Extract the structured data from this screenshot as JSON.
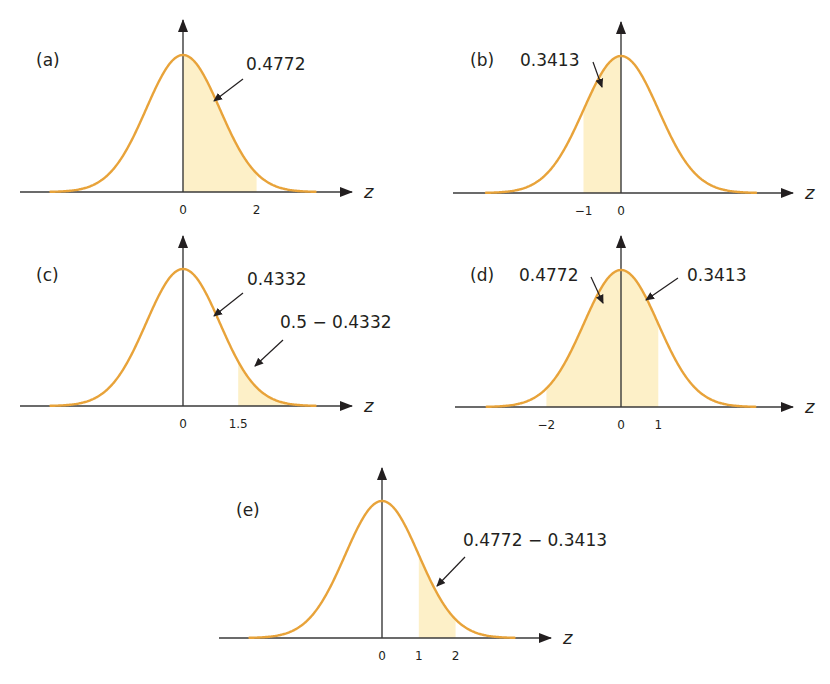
{
  "figure": {
    "colors": {
      "curve": "#e8a33a",
      "shade": "#fdf0c8",
      "axis": "#3a3a3a",
      "text": "#231f20",
      "background": "#ffffff"
    },
    "axis_label": "z"
  },
  "chart_data": [
    {
      "type": "area",
      "id": "a",
      "title": "(a)",
      "description": "Standard normal curve, shaded area between z=0 and z=2",
      "xlabel": "z",
      "xlim": [
        -3.6,
        3.6
      ],
      "tick_labels": [
        "0",
        "2"
      ],
      "tick_values": [
        0,
        2
      ],
      "shaded_interval": [
        0,
        2
      ],
      "annotations": [
        {
          "text": "0.4772",
          "points_to": "shaded region 0 to 2"
        }
      ],
      "layout": {
        "ox": 183,
        "oy": 192,
        "axis_start": 20,
        "axis_end": 352,
        "scale": 36.8,
        "height": 137,
        "yaxis_top": 20,
        "label_x": 36,
        "label_y": 66
      }
    },
    {
      "type": "area",
      "id": "b",
      "title": "(b)",
      "description": "Standard normal curve, shaded area between z=-1 and z=0",
      "xlabel": "z",
      "xlim": [
        -3.6,
        3.6
      ],
      "tick_labels": [
        "−1",
        "0"
      ],
      "tick_values": [
        -1,
        0
      ],
      "shaded_interval": [
        -1,
        0
      ],
      "annotations": [
        {
          "text": "0.3413",
          "points_to": "shaded region -1 to 0"
        }
      ],
      "layout": {
        "ox": 621,
        "oy": 193,
        "axis_start": 453,
        "axis_end": 793,
        "scale": 37.5,
        "height": 137,
        "yaxis_top": 22,
        "label_x": 470,
        "label_y": 66
      }
    },
    {
      "type": "area",
      "id": "c",
      "title": "(c)",
      "description": "Standard normal curve, shaded upper tail beyond z=1.5",
      "xlabel": "z",
      "xlim": [
        -3.6,
        3.6
      ],
      "tick_labels": [
        "0",
        "1.5"
      ],
      "tick_values": [
        0,
        1.5
      ],
      "shaded_interval": [
        1.5,
        3.6
      ],
      "annotations": [
        {
          "text": "0.4332",
          "points_to": "unshaded region 0 to 1.5"
        },
        {
          "text": "0.5 − 0.4332",
          "points_to": "shaded tail beyond 1.5"
        }
      ],
      "layout": {
        "ox": 183,
        "oy": 406,
        "axis_start": 20,
        "axis_end": 352,
        "scale": 36.8,
        "height": 137,
        "yaxis_top": 236,
        "label_x": 36,
        "label_y": 281
      }
    },
    {
      "type": "area",
      "id": "d",
      "title": "(d)",
      "description": "Standard normal curve, shaded area between z=-2 and z=1",
      "xlabel": "z",
      "xlim": [
        -3.6,
        3.6
      ],
      "tick_labels": [
        "−2",
        "0",
        "1"
      ],
      "tick_values": [
        -2,
        0,
        1
      ],
      "shaded_interval": [
        -2,
        1
      ],
      "annotations": [
        {
          "text": "0.4772",
          "points_to": "shaded region -2 to 0"
        },
        {
          "text": "0.3413",
          "points_to": "shaded region 0 to 1"
        }
      ],
      "layout": {
        "ox": 621,
        "oy": 407,
        "axis_start": 455,
        "axis_end": 793,
        "scale": 37.3,
        "height": 137,
        "yaxis_top": 236,
        "label_x": 470,
        "label_y": 281
      }
    },
    {
      "type": "area",
      "id": "e",
      "title": "(e)",
      "description": "Standard normal curve, shaded area between z=1 and z=2",
      "xlabel": "z",
      "xlim": [
        -3.6,
        3.6
      ],
      "tick_labels": [
        "0",
        "1",
        "2"
      ],
      "tick_values": [
        0,
        1,
        2
      ],
      "shaded_interval": [
        1,
        2
      ],
      "annotations": [
        {
          "text": "0.4772 − 0.3413",
          "points_to": "shaded region 1 to 2"
        }
      ],
      "layout": {
        "ox": 382,
        "oy": 638,
        "axis_start": 219,
        "axis_end": 551,
        "scale": 36.8,
        "height": 137,
        "yaxis_top": 468,
        "label_x": 236,
        "label_y": 516
      }
    }
  ],
  "annotation_layout": {
    "a": [
      {
        "tx": 246,
        "ty": 70,
        "x1": 243,
        "y1": 79,
        "x2": 214,
        "y2": 101
      }
    ],
    "b": [
      {
        "tx": 520,
        "ty": 66,
        "x1": 593,
        "y1": 62,
        "x2": 602,
        "y2": 87
      }
    ],
    "c": [
      {
        "tx": 247,
        "ty": 285,
        "x1": 243,
        "y1": 293,
        "x2": 214,
        "y2": 316
      },
      {
        "tx": 280,
        "ty": 328,
        "x1": 283,
        "y1": 340,
        "x2": 255,
        "y2": 366
      }
    ],
    "d": [
      {
        "tx": 519,
        "ty": 281,
        "x1": 591,
        "y1": 277,
        "x2": 603,
        "y2": 303
      },
      {
        "tx": 687,
        "ty": 281,
        "x1": 678,
        "y1": 278,
        "x2": 646,
        "y2": 300
      }
    ],
    "e": [
      {
        "tx": 463,
        "ty": 546,
        "x1": 465,
        "y1": 557,
        "x2": 437,
        "y2": 586
      }
    ]
  }
}
